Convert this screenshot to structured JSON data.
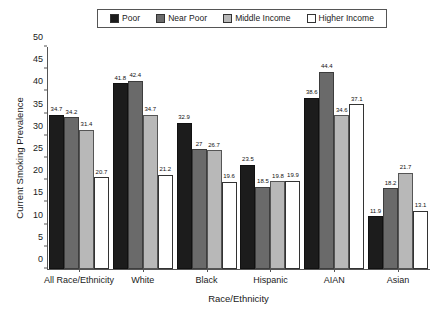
{
  "chart_data": {
    "type": "bar",
    "title": "",
    "xlabel": "Race/Ethnicity",
    "ylabel": "Current Smoking Prevalence",
    "ylim": [
      0,
      50
    ],
    "yticks": [
      0,
      5,
      10,
      15,
      20,
      25,
      30,
      35,
      40,
      45,
      50
    ],
    "grid": false,
    "legend_position": "top-center",
    "categories": [
      "All Race/Ethnicity",
      "White",
      "Black",
      "Hispanic",
      "AIAN",
      "Asian"
    ],
    "series": [
      {
        "name": "Poor",
        "color": "#1c1c1c",
        "values": [
          34.7,
          41.8,
          32.9,
          23.5,
          38.6,
          11.9
        ]
      },
      {
        "name": "Near Poor",
        "color": "#6a6a6a",
        "values": [
          34.2,
          42.4,
          27.0,
          18.5,
          44.4,
          18.2
        ]
      },
      {
        "name": "Middle Income",
        "color": "#b8b8b8",
        "values": [
          31.4,
          34.7,
          26.7,
          19.8,
          34.6,
          21.7
        ]
      },
      {
        "name": "Higher Income",
        "color": "#ffffff",
        "values": [
          20.7,
          21.2,
          19.6,
          19.9,
          37.1,
          13.1
        ]
      }
    ],
    "value_labels": [
      [
        "34.7",
        "34.2",
        "31.4",
        "20.7"
      ],
      [
        "41.8",
        "42.4",
        "34.7",
        "21.2"
      ],
      [
        "32.9",
        "27",
        "26.7",
        "19.6"
      ],
      [
        "23.5",
        "18.5",
        "19.8",
        "19.9"
      ],
      [
        "38.6",
        "44.4",
        "34.6",
        "37.1"
      ],
      [
        "11.9",
        "18.2",
        "21.7",
        "13.1"
      ]
    ]
  }
}
